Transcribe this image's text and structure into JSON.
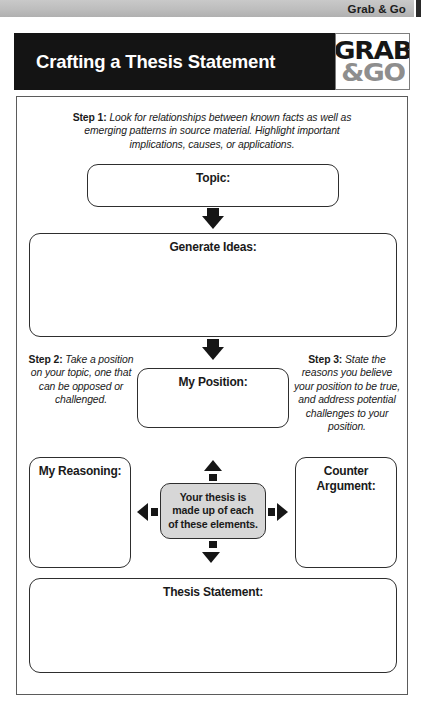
{
  "header": {
    "series_label": "Grab & Go",
    "title": "Crafting a Thesis Statement",
    "logo_line1": "GRAB",
    "logo_line2": "&GO",
    "colors": {
      "title_bar": "#141414",
      "top_strip": "#bdbdbd",
      "logo_grab": "#161616",
      "logo_go": "#8e8e8e"
    }
  },
  "steps": {
    "step1_label": "Step 1:",
    "step1_text": " Look for relationships between known facts as well as emerging patterns in source material. Highlight important implications, causes, or applications.",
    "step2_label": "Step 2:",
    "step2_text": " Take a position on your topic, one that can be opposed or challenged.",
    "step3_label": "Step 3:",
    "step3_text": " State the reasons you believe your position to be true, and address potential challenges to your position."
  },
  "fields": {
    "topic": "Topic:",
    "generate_ideas": "Generate Ideas:",
    "my_position": "My Position:",
    "my_reasoning": "My Reasoning:",
    "counter_argument_line1": "Counter",
    "counter_argument_line2": "Argument:",
    "thesis_statement": "Thesis Statement:"
  },
  "center_note": {
    "line1": "Your thesis is",
    "line2": "made up of each",
    "line3": "of these elements.",
    "fill_color": "#d7d7d7"
  }
}
